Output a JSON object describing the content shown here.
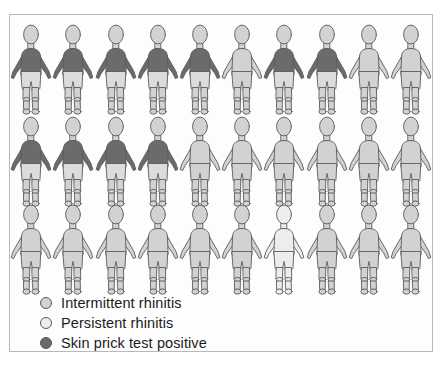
{
  "chart_data": {
    "type": "pictogram",
    "title": "",
    "unit_label": "person",
    "total_units": 30,
    "rows": 3,
    "columns": 10,
    "categories": [
      "Intermittent rhinitis",
      "Persistent rhinitis",
      "Skin prick test positive"
    ],
    "values": [
      29,
      1,
      11
    ],
    "series": [
      {
        "name": "Intermittent rhinitis",
        "value": 29,
        "color": "#d2d2d2"
      },
      {
        "name": "Persistent rhinitis",
        "value": 1,
        "color": "#ededed"
      },
      {
        "name": "Skin prick test positive",
        "value": 11,
        "color": "#6b6b6b"
      }
    ],
    "grid": [
      [
        "spt",
        "spt",
        "spt",
        "spt",
        "spt",
        "intermittent",
        "spt",
        "spt",
        "intermittent",
        "intermittent"
      ],
      [
        "spt",
        "spt",
        "spt",
        "spt",
        "intermittent",
        "intermittent",
        "intermittent",
        "intermittent",
        "intermittent",
        "intermittent"
      ],
      [
        "intermittent",
        "intermittent",
        "intermittent",
        "intermittent",
        "intermittent",
        "intermittent",
        "persistent",
        "intermittent",
        "intermittent",
        "intermittent"
      ]
    ],
    "legend_position": "bottom-left",
    "xlabel": "",
    "ylabel": ""
  },
  "legend": {
    "items": [
      {
        "label": "Intermittent rhinitis",
        "key": "intermittent",
        "color": "#d2d2d2"
      },
      {
        "label": "Persistent rhinitis",
        "key": "persistent",
        "color": "#ededed"
      },
      {
        "label": "Skin prick test positive",
        "key": "spt",
        "color": "#6b6b6b"
      }
    ]
  },
  "style": {
    "outline": "#5a5a5a",
    "body_light": "#d2d2d2",
    "body_white": "#ededed",
    "shirt_dark": "#6b6b6b",
    "shorts_light": "#dcdcdc",
    "frame": "#b9b9b9",
    "background": "#fdfdfd"
  }
}
